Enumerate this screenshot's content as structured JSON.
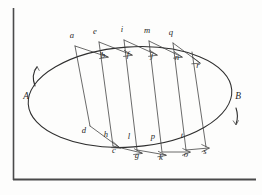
{
  "figure": {
    "background_color": "#fdfdfc",
    "ink_color": "#2e2e2e",
    "frame": {
      "left_rule_name": "left-vertical-rule",
      "bottom_rule_name": "bottom-horizontal-rule"
    },
    "direction_markers": [
      {
        "label": "A",
        "x": 26,
        "y": 99,
        "arrow": "up",
        "name": "direction-marker-a"
      },
      {
        "label": "B",
        "x": 238,
        "y": 99,
        "arrow": "down",
        "name": "direction-marker-b"
      }
    ],
    "upper_outer_labels": [
      {
        "label": "a",
        "x": 72,
        "y": 38
      },
      {
        "label": "e",
        "x": 95,
        "y": 34
      },
      {
        "label": "i",
        "x": 122,
        "y": 32
      },
      {
        "label": "m",
        "x": 147,
        "y": 33
      },
      {
        "label": "q",
        "x": 171,
        "y": 35
      }
    ],
    "upper_inner_labels": [
      {
        "label": "b",
        "x": 103,
        "y": 58
      },
      {
        "label": "f",
        "x": 128,
        "y": 57
      },
      {
        "label": "j",
        "x": 152,
        "y": 58
      },
      {
        "label": "n",
        "x": 177,
        "y": 60
      },
      {
        "label": "r",
        "x": 198,
        "y": 68
      }
    ],
    "lower_inner_labels": [
      {
        "label": "d",
        "x": 84,
        "y": 133
      },
      {
        "label": "h",
        "x": 106,
        "y": 137
      },
      {
        "label": "l",
        "x": 129,
        "y": 139
      },
      {
        "label": "p",
        "x": 153,
        "y": 139
      },
      {
        "label": "t",
        "x": 182,
        "y": 138
      }
    ],
    "lower_outer_labels": [
      {
        "label": "c",
        "x": 114,
        "y": 153
      },
      {
        "label": "g",
        "x": 137,
        "y": 158
      },
      {
        "label": "k",
        "x": 161,
        "y": 160
      },
      {
        "label": "o",
        "x": 186,
        "y": 157
      },
      {
        "label": "s",
        "x": 205,
        "y": 154
      }
    ],
    "ellipse": {
      "center_x": 130,
      "center_y": 97,
      "radius_x": 102,
      "radius_y": 50,
      "rotation_deg": -4,
      "name": "orbit-ellipse"
    },
    "radial_chords": [
      {
        "name": "chord-a-d",
        "x1": 75,
        "y1": 46,
        "x2": 90,
        "y2": 126
      },
      {
        "name": "chord-e-h",
        "x1": 99,
        "y1": 42,
        "x2": 113,
        "y2": 146
      },
      {
        "name": "chord-i-l",
        "x1": 124,
        "y1": 40,
        "x2": 137,
        "y2": 150
      },
      {
        "name": "chord-m-p",
        "x1": 149,
        "y1": 41,
        "x2": 162,
        "y2": 152
      },
      {
        "name": "chord-q-t",
        "x1": 173,
        "y1": 43,
        "x2": 186,
        "y2": 150
      },
      {
        "name": "chord-r-s",
        "x1": 192,
        "y1": 52,
        "x2": 206,
        "y2": 147
      }
    ],
    "upper_tangents": [
      {
        "name": "tangent-a-b",
        "x1": 75,
        "y1": 46,
        "x2": 108,
        "y2": 57
      },
      {
        "name": "tangent-e-f",
        "x1": 99,
        "y1": 42,
        "x2": 132,
        "y2": 55
      },
      {
        "name": "tangent-i-j",
        "x1": 124,
        "y1": 40,
        "x2": 157,
        "y2": 55
      },
      {
        "name": "tangent-m-n",
        "x1": 149,
        "y1": 41,
        "x2": 182,
        "y2": 57
      },
      {
        "name": "tangent-q-r",
        "x1": 173,
        "y1": 43,
        "x2": 200,
        "y2": 63
      }
    ],
    "lower_tangents": [
      {
        "name": "tangent-d-c",
        "x1": 90,
        "y1": 126,
        "x2": 120,
        "y2": 148
      },
      {
        "name": "tangent-h-g",
        "x1": 113,
        "y1": 146,
        "x2": 142,
        "y2": 153
      },
      {
        "name": "tangent-l-k",
        "x1": 137,
        "y1": 150,
        "x2": 166,
        "y2": 155
      },
      {
        "name": "tangent-p-o",
        "x1": 162,
        "y1": 152,
        "x2": 190,
        "y2": 152
      },
      {
        "name": "tangent-t-s",
        "x1": 186,
        "y1": 150,
        "x2": 209,
        "y2": 148
      }
    ]
  }
}
